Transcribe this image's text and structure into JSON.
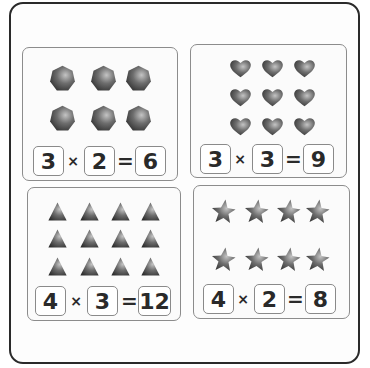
{
  "colors": {
    "frame_border": "#2a2a2a",
    "panel_border": "#8c8c8c",
    "shape_dark": "#3a3a3a",
    "shape_light": "#b8b8b8",
    "text": "#2a2a2a"
  },
  "panels": [
    {
      "shape": "heptagon",
      "rows": 2,
      "cols": 3,
      "equation": {
        "a": "3",
        "op": "×",
        "b": "2",
        "eq": "=",
        "result": "6"
      }
    },
    {
      "shape": "heart",
      "rows": 3,
      "cols": 3,
      "equation": {
        "a": "3",
        "op": "×",
        "b": "3",
        "eq": "=",
        "result": "9"
      }
    },
    {
      "shape": "triangle",
      "rows": 3,
      "cols": 4,
      "equation": {
        "a": "4",
        "op": "×",
        "b": "3",
        "eq": "=",
        "result": "12"
      }
    },
    {
      "shape": "star",
      "rows": 2,
      "cols": 4,
      "equation": {
        "a": "4",
        "op": "×",
        "b": "2",
        "eq": "=",
        "result": "8"
      }
    }
  ]
}
